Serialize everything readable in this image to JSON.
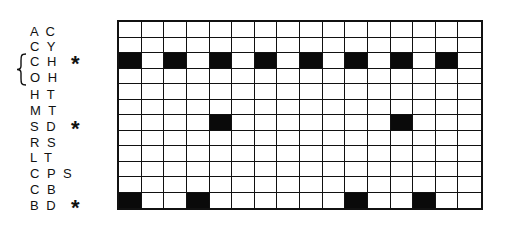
{
  "diagram": {
    "columns": 16,
    "rows": [
      {
        "label": "A C",
        "marked": false,
        "filled": []
      },
      {
        "label": "C Y",
        "marked": false,
        "filled": []
      },
      {
        "label": "C H",
        "marked": true,
        "filled": [
          1,
          3,
          5,
          7,
          9,
          11,
          13,
          15
        ]
      },
      {
        "label": "O H",
        "marked": false,
        "filled": []
      },
      {
        "label": "H T",
        "marked": false,
        "filled": []
      },
      {
        "label": "M T",
        "marked": false,
        "filled": []
      },
      {
        "label": "S D",
        "marked": true,
        "filled": [
          5,
          13
        ]
      },
      {
        "label": "R S",
        "marked": false,
        "filled": []
      },
      {
        "label": "L T",
        "marked": false,
        "filled": []
      },
      {
        "label": "C P S",
        "marked": false,
        "filled": []
      },
      {
        "label": "C B",
        "marked": false,
        "filled": []
      },
      {
        "label": "B D",
        "marked": true,
        "filled": [
          1,
          4,
          11,
          14
        ]
      }
    ],
    "marker_symbol": "*",
    "brace_groups": [
      {
        "rows": [
          "C H",
          "O H"
        ],
        "symbol": "{"
      }
    ],
    "colors": {
      "filled": "#0a0a0a",
      "empty": "#ffffff",
      "lines": "#111111"
    }
  }
}
